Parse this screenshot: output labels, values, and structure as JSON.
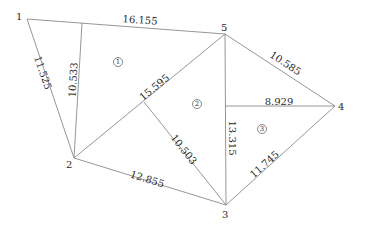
{
  "diagram": {
    "type": "triangulated-survey-polygon",
    "nodes": [
      {
        "id": "1",
        "label": "1",
        "x": 27,
        "y": 19,
        "lx": 16,
        "ly": 20
      },
      {
        "id": "2",
        "label": "2",
        "x": 74,
        "y": 158,
        "lx": 66,
        "ly": 168
      },
      {
        "id": "3",
        "label": "3",
        "x": 226,
        "y": 205,
        "lx": 222,
        "ly": 218
      },
      {
        "id": "4",
        "label": "4",
        "x": 335,
        "y": 106,
        "lx": 338,
        "ly": 110
      },
      {
        "id": "5",
        "label": "5",
        "x": 225,
        "y": 34,
        "lx": 221,
        "ly": 31
      }
    ],
    "edges": [
      {
        "from": [
          27,
          19
        ],
        "to": [
          225,
          34
        ],
        "label": "16.155",
        "lx": 140,
        "ly": 21,
        "rot": 4.3
      },
      {
        "from": [
          27,
          19
        ],
        "to": [
          74,
          158
        ],
        "label": "11.525",
        "lx": 42,
        "ly": 73,
        "rot": 71.3
      },
      {
        "from": [
          82,
          23
        ],
        "to": [
          74,
          158
        ],
        "label": "10.533",
        "lx": 74,
        "ly": 80,
        "rot": -86.6
      },
      {
        "from": [
          74,
          158
        ],
        "to": [
          225,
          34
        ],
        "label": "15.595",
        "lx": 155,
        "ly": 88,
        "rot": -39.4
      },
      {
        "from": [
          144,
          102
        ],
        "to": [
          226,
          205
        ],
        "label": "10.503",
        "lx": 183,
        "ly": 150,
        "rot": 51.5
      },
      {
        "from": [
          74,
          158
        ],
        "to": [
          226,
          205
        ],
        "label": "12.855",
        "lx": 147,
        "ly": 180,
        "rot": 17.2
      },
      {
        "from": [
          225,
          34
        ],
        "to": [
          226,
          205
        ],
        "label": "13.315",
        "lx": 231,
        "ly": 138,
        "rot": 90
      },
      {
        "from": [
          225,
          34
        ],
        "to": [
          335,
          106
        ],
        "label": "10.585",
        "lx": 285,
        "ly": 64,
        "rot": 33.2
      },
      {
        "from": [
          225,
          106
        ],
        "to": [
          335,
          106
        ],
        "label": "8.929",
        "lx": 279,
        "ly": 102,
        "rot": 0
      },
      {
        "from": [
          226,
          205
        ],
        "to": [
          335,
          106
        ],
        "label": "11.745",
        "lx": 265,
        "ly": 165,
        "rot": -42.2
      }
    ],
    "regions": [
      {
        "label": "1",
        "x": 118,
        "y": 62
      },
      {
        "label": "2",
        "x": 197,
        "y": 104
      },
      {
        "label": "3",
        "x": 262,
        "y": 129
      }
    ]
  }
}
